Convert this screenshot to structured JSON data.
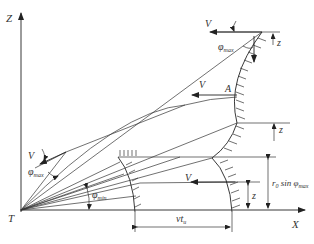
{
  "diagram": {
    "axes": {
      "z_label": "Z",
      "x_label": "X",
      "origin_label": "T"
    },
    "labels": {
      "v_top": "V",
      "phi_max_top": "φ",
      "phi_max_top_sub": "max",
      "z_top": "z",
      "v_mid": "V",
      "point_a": "A",
      "z_mid": "z",
      "v_left": "V",
      "phi_max_left": "φ",
      "phi_max_left_sub": "max",
      "phi_min": "φ",
      "phi_min_sub": "min",
      "v_low": "V",
      "z_low": "z",
      "r0_sin": "r",
      "r0_sub": "0",
      "r0_sin_word": " sin φ",
      "r0_sin_sub": "max",
      "vt": "vt",
      "vt_sub": "u"
    },
    "colors": {
      "stroke": "#222222",
      "text": "#333333",
      "background": "#ffffff"
    }
  }
}
